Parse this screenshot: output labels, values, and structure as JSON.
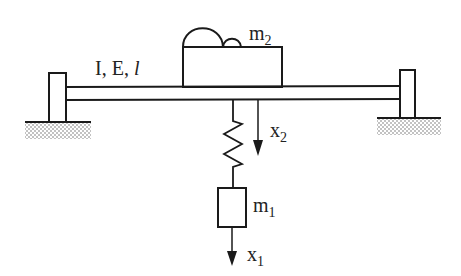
{
  "diagram": {
    "beam_label": "I, E, ",
    "beam_length_symbol": "l",
    "mass_top": {
      "symbol": "m",
      "subscript": "2"
    },
    "mass_bottom": {
      "symbol": "m",
      "subscript": "1"
    },
    "displacement_top": {
      "symbol": "x",
      "subscript": "2"
    },
    "displacement_bottom": {
      "symbol": "x",
      "subscript": "1"
    }
  },
  "colors": {
    "stroke": "#1a1a1a",
    "ground_hatch": "#555555",
    "background": "#ffffff"
  }
}
